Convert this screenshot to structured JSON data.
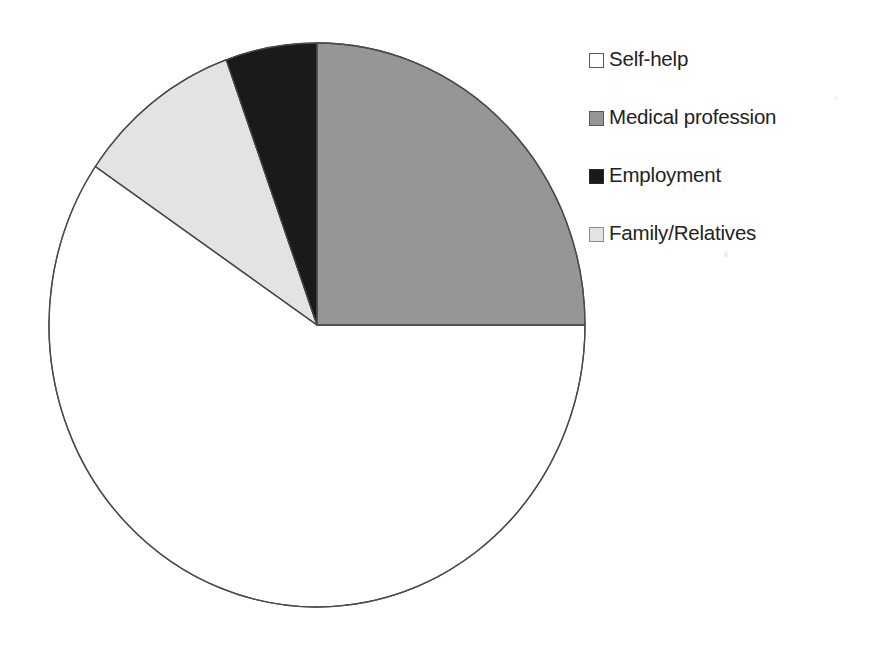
{
  "chart_data": {
    "type": "pie",
    "title": "",
    "subtitle": "",
    "xlabel": "",
    "ylabel": "",
    "legend_position": "right",
    "grid": false,
    "categories": [
      "Self-help",
      "Medical profession",
      "Employment",
      "Family/Relatives"
    ],
    "values": [
      59.5,
      25.0,
      5.5,
      10.0
    ],
    "units": "percent",
    "start_angle_deg": 90,
    "direction": "clockwise",
    "slices": [
      {
        "label": "Self-help",
        "value": 59.5,
        "sweep_deg": 214.2,
        "color": "#ffffff",
        "swatch_color": "#ffffff",
        "swatch_border": "#585858"
      },
      {
        "label": "Medical profession",
        "value": 25.0,
        "sweep_deg": 90.0,
        "color": "#969696",
        "swatch_color": "#969696",
        "swatch_border": "#585858"
      },
      {
        "label": "Employment",
        "value": 5.5,
        "sweep_deg": 19.8,
        "color": "#1a1a1a",
        "swatch_color": "#1a1a1a",
        "swatch_border": "#2a2a2a"
      },
      {
        "label": "Family/Relatives",
        "value": 10.0,
        "sweep_deg": 36.0,
        "color": "#e3e3e3",
        "swatch_color": "#e3e3e3",
        "swatch_border": "#8d8d8d"
      }
    ],
    "outline_color": "#4a4a4a",
    "background_color": "#ffffff"
  },
  "legend": {
    "items": [
      {
        "label": "Self-help",
        "icon": "legend-swatch-icon"
      },
      {
        "label": "Medical profession",
        "icon": "legend-swatch-icon"
      },
      {
        "label": "Employment",
        "icon": "legend-swatch-icon"
      },
      {
        "label": "Family/Relatives",
        "icon": "legend-swatch-icon"
      }
    ]
  }
}
